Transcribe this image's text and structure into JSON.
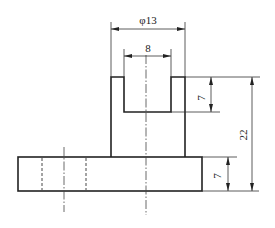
{
  "drawing": {
    "type": "orthographic front view with dimensions",
    "dimensions": {
      "outer_diameter": "φ13",
      "inner_width": "8",
      "slot_depth": "7",
      "total_height": "22",
      "base_thickness": "7"
    }
  }
}
